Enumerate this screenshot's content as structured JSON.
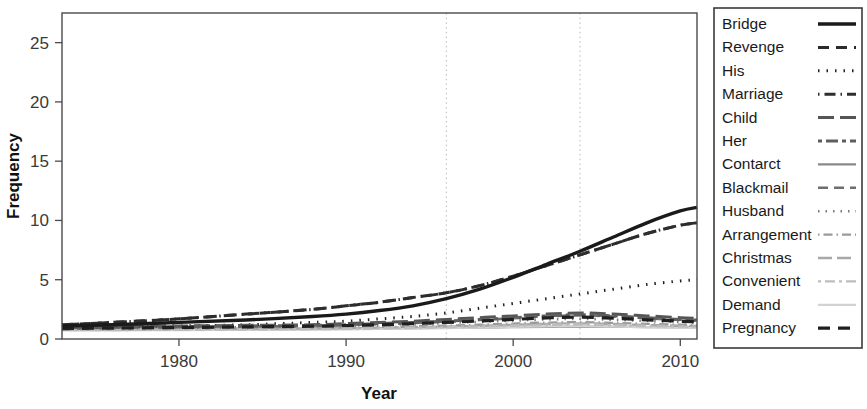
{
  "chart_data": {
    "type": "line",
    "title": "",
    "xlabel": "Year",
    "ylabel": "Frequency",
    "xlim": [
      1973,
      2011
    ],
    "ylim": [
      0,
      27.5
    ],
    "grid": "vertical-dotted",
    "gridlines_x": [
      1996,
      2004
    ],
    "legend_position": "right-outside",
    "xticks": [
      1980,
      1990,
      2000,
      2010
    ],
    "xtick_labels": [
      "1980",
      "1990",
      "2000",
      "2010"
    ],
    "yticks": [
      0,
      5,
      10,
      15,
      20,
      25
    ],
    "ytick_labels": [
      "0",
      "5",
      "10",
      "15",
      "20",
      "25"
    ],
    "x": [
      1973,
      1976,
      1980,
      1984,
      1988,
      1990,
      1992,
      1994,
      1996,
      1998,
      2000,
      2002,
      2004,
      2006,
      2008,
      2010,
      2011
    ],
    "series": [
      {
        "name": "Bridge",
        "style": "solid",
        "color": "#1a1a1a",
        "width": 3.4,
        "dash": "none",
        "values": [
          1.1,
          1.2,
          1.4,
          1.6,
          1.9,
          2.1,
          2.4,
          2.8,
          3.4,
          4.2,
          5.2,
          6.3,
          7.4,
          8.6,
          9.8,
          10.8,
          11.1
        ]
      },
      {
        "name": "Revenge",
        "style": "dashed",
        "color": "#2b2b2b",
        "width": 3.0,
        "dash": "11 7",
        "values": [
          1.2,
          1.4,
          1.7,
          2.1,
          2.5,
          2.8,
          3.1,
          3.5,
          3.9,
          4.5,
          5.3,
          6.2,
          7.1,
          8.0,
          8.9,
          9.6,
          9.8
        ]
      },
      {
        "name": "His",
        "style": "dotted",
        "color": "#222222",
        "width": 3.0,
        "dash": "1.5 7",
        "values": [
          0.9,
          1.0,
          1.1,
          1.2,
          1.4,
          1.5,
          1.7,
          1.9,
          2.2,
          2.6,
          3.0,
          3.4,
          3.8,
          4.2,
          4.6,
          4.9,
          5.0
        ]
      },
      {
        "name": "Marriage",
        "style": "dotdash",
        "color": "#2e2e2e",
        "width": 3.0,
        "dash": "1.5 5 11 5",
        "values": [
          1.2,
          1.4,
          1.7,
          2.1,
          2.5,
          2.8,
          3.1,
          3.5,
          3.9,
          4.5,
          5.3,
          6.2,
          7.1,
          8.0,
          8.9,
          9.6,
          9.8
        ]
      },
      {
        "name": "Child",
        "style": "longdash",
        "color": "#555555",
        "width": 3.0,
        "dash": "16 6",
        "values": [
          1.0,
          1.05,
          1.1,
          1.15,
          1.2,
          1.3,
          1.4,
          1.5,
          1.65,
          1.8,
          1.95,
          2.1,
          2.2,
          2.1,
          1.95,
          1.8,
          1.75
        ]
      },
      {
        "name": "Her",
        "style": "twodash",
        "color": "#5e5e5e",
        "width": 3.0,
        "dash": "4 4 12 4",
        "values": [
          0.95,
          1.0,
          1.05,
          1.1,
          1.15,
          1.2,
          1.3,
          1.4,
          1.5,
          1.65,
          1.8,
          1.95,
          2.05,
          1.95,
          1.8,
          1.65,
          1.6
        ]
      },
      {
        "name": "Contarct",
        "style": "solid",
        "color": "#8a8a8a",
        "width": 2.2,
        "dash": "none",
        "values": [
          0.8,
          0.8,
          0.82,
          0.84,
          0.86,
          0.88,
          0.9,
          0.92,
          0.95,
          0.97,
          1.0,
          1.02,
          1.05,
          1.03,
          1.0,
          0.98,
          0.97
        ]
      },
      {
        "name": "Blackmail",
        "style": "dashed",
        "color": "#6e6e6e",
        "width": 2.6,
        "dash": "10 6",
        "values": [
          0.9,
          0.95,
          1.0,
          1.05,
          1.1,
          1.18,
          1.25,
          1.35,
          1.45,
          1.6,
          1.75,
          1.9,
          2.0,
          1.9,
          1.75,
          1.6,
          1.55
        ]
      },
      {
        "name": "Husband",
        "style": "dotted",
        "color": "#7a7a7a",
        "width": 2.6,
        "dash": "1.5 6",
        "values": [
          0.85,
          0.9,
          0.95,
          1.0,
          1.05,
          1.1,
          1.18,
          1.25,
          1.35,
          1.45,
          1.55,
          1.65,
          1.7,
          1.62,
          1.52,
          1.42,
          1.4
        ]
      },
      {
        "name": "Arrangement",
        "style": "dotdash",
        "color": "#9a9a9a",
        "width": 2.4,
        "dash": "1.5 4 9 4",
        "values": [
          0.8,
          0.82,
          0.85,
          0.88,
          0.92,
          0.96,
          1.0,
          1.06,
          1.12,
          1.2,
          1.3,
          1.38,
          1.42,
          1.36,
          1.28,
          1.2,
          1.18
        ]
      },
      {
        "name": "Christmas",
        "style": "longdash",
        "color": "#a8a8a8",
        "width": 2.4,
        "dash": "14 5",
        "values": [
          0.78,
          0.8,
          0.82,
          0.85,
          0.88,
          0.92,
          0.96,
          1.0,
          1.05,
          1.12,
          1.2,
          1.28,
          1.32,
          1.26,
          1.18,
          1.12,
          1.1
        ]
      },
      {
        "name": "Convenient",
        "style": "twodash",
        "color": "#bdbdbd",
        "width": 2.4,
        "dash": "3 4 10 4",
        "values": [
          0.75,
          0.76,
          0.78,
          0.8,
          0.83,
          0.86,
          0.9,
          0.94,
          0.99,
          1.05,
          1.12,
          1.18,
          1.22,
          1.16,
          1.1,
          1.04,
          1.02
        ]
      },
      {
        "name": "Demand",
        "style": "solid",
        "color": "#d2d2d2",
        "width": 2.2,
        "dash": "none",
        "values": [
          0.72,
          0.73,
          0.75,
          0.77,
          0.79,
          0.82,
          0.85,
          0.88,
          0.92,
          0.97,
          1.02,
          1.07,
          1.1,
          1.05,
          1.0,
          0.95,
          0.93
        ]
      },
      {
        "name": "Pregnancy",
        "style": "dashed",
        "color": "#1f1f1f",
        "width": 3.2,
        "dash": "12 8",
        "values": [
          0.88,
          0.92,
          0.97,
          1.02,
          1.08,
          1.14,
          1.2,
          1.3,
          1.4,
          1.52,
          1.65,
          1.78,
          1.85,
          1.75,
          1.62,
          1.5,
          1.46
        ]
      }
    ]
  },
  "axes": {
    "x_title": "Year",
    "y_title": "Frequency"
  },
  "legend": {
    "entries": [
      {
        "label": "Bridge"
      },
      {
        "label": "Revenge"
      },
      {
        "label": "His"
      },
      {
        "label": "Marriage"
      },
      {
        "label": "Child"
      },
      {
        "label": "Her"
      },
      {
        "label": "Contarct"
      },
      {
        "label": "Blackmail"
      },
      {
        "label": "Husband"
      },
      {
        "label": "Arrangement"
      },
      {
        "label": "Christmas"
      },
      {
        "label": "Convenient"
      },
      {
        "label": "Demand"
      },
      {
        "label": "Pregnancy"
      }
    ]
  }
}
